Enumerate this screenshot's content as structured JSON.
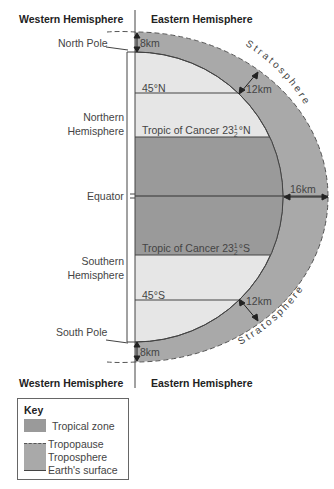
{
  "headers": {
    "top_west": "Western Hemisphere",
    "top_east": "Eastern Hemisphere",
    "bottom_west": "Western Hemisphere",
    "bottom_east": "Eastern Hemisphere"
  },
  "labels": {
    "north_pole": "North Pole",
    "south_pole": "South Pole",
    "northern_hemisphere_1": "Northern",
    "northern_hemisphere_2": "Hemisphere",
    "southern_hemisphere_1": "Southern",
    "southern_hemisphere_2": "Hemisphere",
    "equator": "Equator",
    "lat_45n": "45°N",
    "lat_45s": "45°S",
    "tropic_n_prefix": "Tropic of Cancer 23",
    "tropic_n_suffix": "°N",
    "tropic_s_prefix": "Tropic of Cancer 23",
    "tropic_s_suffix": "°S",
    "frac_num": "1",
    "frac_den": "2",
    "stratosphere": "Stratosphere"
  },
  "measurements": {
    "north_pole_height": "8km",
    "south_pole_height": "8km",
    "mid_north_height": "12km",
    "mid_south_height": "12km",
    "equator_height": "16km"
  },
  "key": {
    "title": "Key",
    "tropical_zone": "Tropical zone",
    "tropopause": "Tropopause",
    "troposphere": "Troposphere",
    "earths_surface": "Earth's surface"
  },
  "colors": {
    "troposphere": "#a9a9a9",
    "tropical_zone": "#9a9a9a",
    "earth_light": "#e6e6e6",
    "lines": "#444444"
  }
}
